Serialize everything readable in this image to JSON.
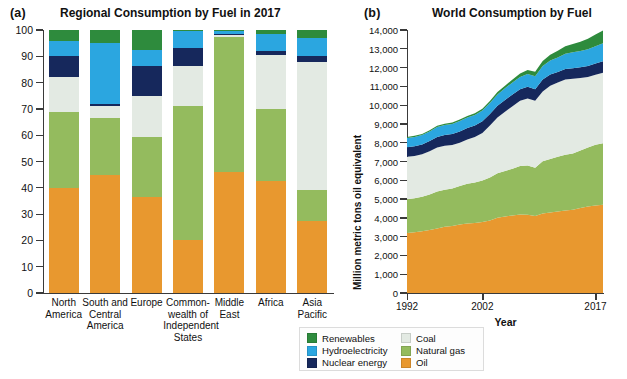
{
  "figure": {
    "panel_a_letter": "(a)",
    "panel_b_letter": "(b)"
  },
  "colors": {
    "renewables": "#2e8b3d",
    "hydroelectricity": "#2ba6e0",
    "nuclear": "#16285c",
    "coal": "#e3eae3",
    "natural_gas": "#94bb5e",
    "oil": "#e8982f",
    "axis": "#3a3a3a",
    "text": "#111111"
  },
  "legend": {
    "column_1": [
      {
        "label": "Renewables",
        "color": "#2e8b3d",
        "key": "renewables"
      },
      {
        "label": "Hydroelectricity",
        "color": "#2ba6e0",
        "key": "hydroelectricity"
      },
      {
        "label": "Nuclear energy",
        "color": "#16285c",
        "key": "nuclear"
      }
    ],
    "column_2": [
      {
        "label": "Coal",
        "color": "#e3eae3",
        "key": "coal"
      },
      {
        "label": "Natural gas",
        "color": "#94bb5e",
        "key": "natural_gas"
      },
      {
        "label": "Oil",
        "color": "#e8982f",
        "key": "oil"
      }
    ]
  },
  "chart_data": [
    {
      "id": "panel-a",
      "type": "bar",
      "stacked": true,
      "title": "Regional Consumption by Fuel in 2017",
      "xlabel": "",
      "ylabel": "Percentage",
      "ylim": [
        0,
        100
      ],
      "yticks": [
        0,
        10,
        20,
        30,
        40,
        50,
        60,
        70,
        80,
        90,
        100
      ],
      "ytick_labels": [
        "0",
        "10",
        "20",
        "30",
        "40",
        "50",
        "60",
        "70",
        "80",
        "90",
        "100"
      ],
      "grid": false,
      "legend_position": "bottom-center-shared",
      "categories": [
        "North America",
        "South and Central America",
        "Europe",
        "Commonwealth of Independent States",
        "Middle East",
        "Africa",
        "Asia Pacific"
      ],
      "category_lines": [
        [
          "North",
          "America"
        ],
        [
          "South and",
          "Central",
          "America"
        ],
        [
          "Europe"
        ],
        [
          "Common-",
          "wealth of",
          "Independent",
          "States"
        ],
        [
          "Middle",
          "East"
        ],
        [
          "Africa"
        ],
        [
          "Asia",
          "Pacific"
        ]
      ],
      "series": [
        {
          "name": "Oil",
          "key": "oil",
          "values": [
            40.0,
            45.0,
            36.5,
            20.0,
            46.0,
            42.5,
            27.5
          ]
        },
        {
          "name": "Natural gas",
          "key": "natural_gas",
          "values": [
            29.0,
            21.5,
            23.0,
            51.0,
            51.5,
            27.5,
            11.5
          ]
        },
        {
          "name": "Coal",
          "key": "coal",
          "values": [
            13.0,
            4.5,
            15.5,
            15.5,
            0.8,
            20.5,
            49.0
          ]
        },
        {
          "name": "Nuclear energy",
          "key": "nuclear",
          "values": [
            8.0,
            1.0,
            11.5,
            6.5,
            0.3,
            1.5,
            2.0
          ]
        },
        {
          "name": "Hydroelectricity",
          "key": "hydroelectricity",
          "values": [
            6.0,
            23.0,
            6.0,
            6.5,
            0.9,
            6.5,
            7.0
          ]
        },
        {
          "name": "Renewables",
          "key": "renewables",
          "values": [
            4.0,
            5.0,
            7.5,
            0.5,
            0.5,
            1.5,
            3.0
          ]
        }
      ]
    },
    {
      "id": "panel-b",
      "type": "area",
      "stacked": true,
      "title": "World Consumption by Fuel",
      "xlabel": "Year",
      "ylabel": "Million metric tons oil equivalent",
      "ylim": [
        0,
        14000
      ],
      "yticks": [
        0,
        1000,
        2000,
        3000,
        4000,
        5000,
        6000,
        7000,
        8000,
        9000,
        10000,
        11000,
        12000,
        13000,
        14000
      ],
      "ytick_labels": [
        "0",
        "1,000",
        "2,000",
        "3,000",
        "4,000",
        "5,000",
        "6,000",
        "7,000",
        "8,000",
        "9,000",
        "10,000",
        "11,000",
        "12,000",
        "13,000",
        "14,000"
      ],
      "xlim": [
        1992,
        2018
      ],
      "xticks": [
        1992,
        2002,
        2017
      ],
      "xtick_labels": [
        "1992",
        "2002",
        "2017"
      ],
      "grid": false,
      "legend_position": "bottom-center-shared",
      "x": [
        1992,
        1993,
        1994,
        1995,
        1996,
        1997,
        1998,
        1999,
        2000,
        2001,
        2002,
        2003,
        2004,
        2005,
        2006,
        2007,
        2008,
        2009,
        2010,
        2011,
        2012,
        2013,
        2014,
        2015,
        2016,
        2017,
        2018
      ],
      "series": [
        {
          "name": "Oil",
          "key": "oil",
          "values": [
            3200,
            3230,
            3290,
            3350,
            3440,
            3530,
            3570,
            3650,
            3700,
            3730,
            3780,
            3860,
            4010,
            4070,
            4130,
            4180,
            4160,
            4100,
            4230,
            4280,
            4340,
            4390,
            4430,
            4520,
            4600,
            4660,
            4700
          ]
        },
        {
          "name": "Natural gas",
          "key": "natural_gas",
          "values": [
            1790,
            1810,
            1830,
            1890,
            1960,
            1960,
            1990,
            2040,
            2120,
            2150,
            2210,
            2290,
            2360,
            2430,
            2490,
            2580,
            2630,
            2570,
            2780,
            2850,
            2910,
            2970,
            2990,
            3060,
            3150,
            3230,
            3270
          ]
        },
        {
          "name": "Coal",
          "key": "coal",
          "values": [
            2260,
            2250,
            2260,
            2300,
            2340,
            2350,
            2320,
            2310,
            2350,
            2420,
            2530,
            2760,
            2970,
            3150,
            3320,
            3470,
            3570,
            3570,
            3720,
            3900,
            3950,
            4000,
            3980,
            3860,
            3750,
            3730,
            3760
          ]
        },
        {
          "name": "Nuclear energy",
          "key": "nuclear",
          "values": [
            510,
            520,
            530,
            550,
            570,
            570,
            580,
            600,
            610,
            620,
            620,
            620,
            630,
            630,
            630,
            620,
            620,
            610,
            630,
            600,
            560,
            560,
            570,
            580,
            590,
            600,
            610
          ]
        },
        {
          "name": "Hydroelectricity",
          "key": "hydroelectricity",
          "values": [
            490,
            500,
            500,
            510,
            530,
            530,
            540,
            550,
            560,
            550,
            570,
            580,
            600,
            620,
            640,
            650,
            680,
            690,
            720,
            740,
            780,
            810,
            840,
            860,
            890,
            920,
            950
          ]
        },
        {
          "name": "Renewables",
          "key": "renewables",
          "values": [
            50,
            55,
            58,
            62,
            66,
            70,
            75,
            82,
            88,
            95,
            103,
            112,
            124,
            138,
            156,
            180,
            208,
            232,
            270,
            312,
            355,
            400,
            450,
            500,
            560,
            620,
            680
          ]
        }
      ]
    }
  ]
}
